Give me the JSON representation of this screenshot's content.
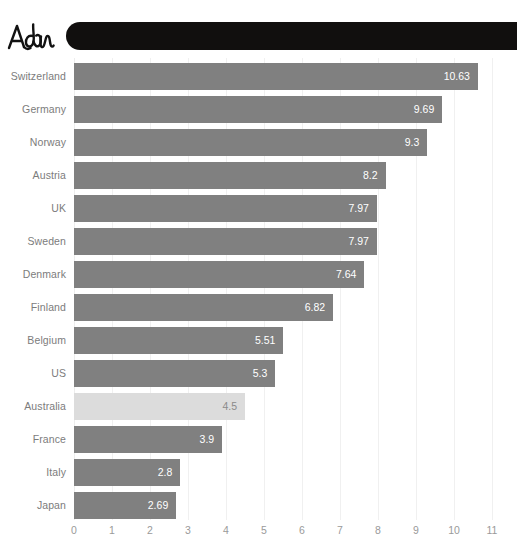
{
  "annotation": {
    "handwritten_note": "Adam",
    "redaction_label": "redacted-title-bar"
  },
  "chart_data": {
    "type": "bar",
    "orientation": "horizontal",
    "title": "",
    "xlabel": "",
    "ylabel": "",
    "xlim": [
      0,
      11
    ],
    "xticks": [
      0,
      1,
      2,
      3,
      4,
      5,
      6,
      7,
      8,
      9,
      10,
      11
    ],
    "xtick_labels": [
      "0",
      "1",
      "2",
      "3",
      "4",
      "5",
      "6",
      "7",
      "8",
      "9",
      "10",
      "11"
    ],
    "grid": true,
    "legend": "none",
    "categories": [
      "Switzerland",
      "Germany",
      "Norway",
      "Austria",
      "UK",
      "Sweden",
      "Denmark",
      "Finland",
      "Belgium",
      "US",
      "Australia",
      "France",
      "Italy",
      "Japan"
    ],
    "values": [
      10.63,
      9.69,
      9.3,
      8.2,
      7.97,
      7.97,
      7.64,
      6.82,
      5.51,
      5.3,
      4.5,
      3.9,
      2.8,
      2.69
    ],
    "value_labels": [
      "10.63",
      "9.69",
      "9.3",
      "8.2",
      "7.97",
      "7.97",
      "7.64",
      "6.82",
      "5.51",
      "5.3",
      "4.5",
      "3.9",
      "2.8",
      "2.69"
    ],
    "highlighted_category": "Australia",
    "colors": {
      "bar": "#808080",
      "bar_highlight": "#dcdcdc",
      "value_text": "#ffffff",
      "value_text_highlight": "#8a8a8a",
      "category_text": "#7c7c7c",
      "axis_text": "#9a9a9a",
      "gridline": "#f0f0f0",
      "background": "#ffffff",
      "redaction": "#110f0e"
    }
  }
}
